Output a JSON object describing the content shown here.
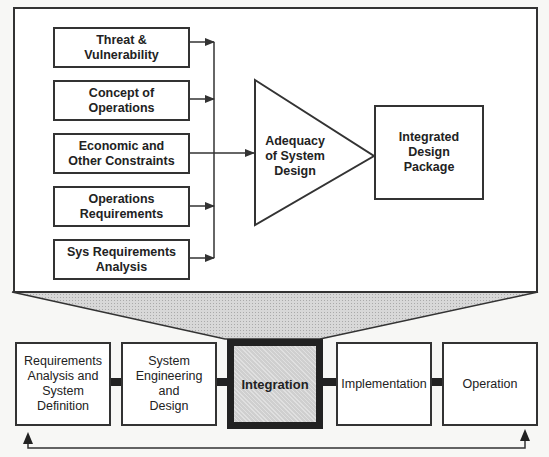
{
  "detail": {
    "inputs": [
      {
        "label": "Threat &\nVulnerability"
      },
      {
        "label": "Concept of\nOperations"
      },
      {
        "label": "Economic and\nOther Constraints"
      },
      {
        "label": "Operations\nRequirements"
      },
      {
        "label": "Sys Requirements\nAnalysis"
      }
    ],
    "gate_label": "Adequacy\nof System\nDesign",
    "output_label": "Integrated\nDesign\nPackage"
  },
  "lifecycle": {
    "phases": [
      {
        "label": "Requirements\nAnalysis and\nSystem\nDefinition"
      },
      {
        "label": "System\nEngineering\nand\nDesign"
      },
      {
        "label": "Integration",
        "highlighted": true
      },
      {
        "label": "Implementation"
      },
      {
        "label": "Operation"
      }
    ],
    "feedback_loop": "Operation returns to Requirements Analysis and System Definition"
  },
  "colors": {
    "line": "#333333",
    "highlight_fill": "#cfcfcf",
    "background": "#f7f7f5"
  }
}
